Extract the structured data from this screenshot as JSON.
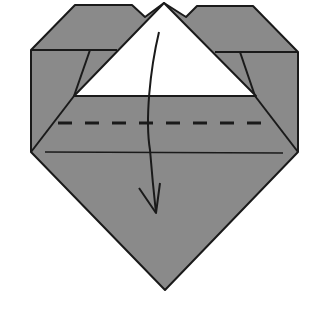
{
  "diagram": {
    "colors": {
      "paper_gray": "#8a8a8a",
      "paper_white": "#ffffff",
      "line": "#1a1a1a",
      "background": "#ffffff"
    },
    "elements": [
      {
        "name": "heart-body",
        "description": "gray folded heart shape"
      },
      {
        "name": "white-triangle-flap",
        "description": "white top triangle flap"
      },
      {
        "name": "valley-fold-line",
        "description": "dashed fold line"
      },
      {
        "name": "fold-arrow",
        "description": "curved arrow pointing down"
      }
    ]
  }
}
